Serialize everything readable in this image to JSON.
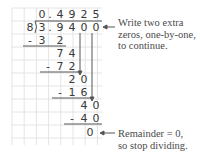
{
  "quotient": [
    "0",
    ".",
    "4",
    "9",
    "2",
    "5"
  ],
  "divisor": "8",
  "dividend": [
    "3",
    ".",
    "9",
    "4",
    "0",
    "0"
  ],
  "steps": [
    {
      "sub": [
        "-",
        "3",
        "2"
      ]
    },
    {
      "rem": [
        "7",
        "4"
      ]
    },
    {
      "sub": [
        "-",
        "7",
        "2"
      ]
    },
    {
      "rem": [
        "2",
        "0"
      ]
    },
    {
      "sub": [
        "-",
        "1",
        "6"
      ]
    },
    {
      "rem": [
        "4",
        "0"
      ]
    },
    {
      "sub": [
        "-",
        "4",
        "0"
      ]
    },
    {
      "rem": [
        "0"
      ]
    }
  ],
  "annotations": {
    "extra_zeros": [
      "Write two extra",
      "zeros, one-by-one,",
      "to continue."
    ],
    "remainder": [
      "Remainder = 0,",
      "so stop dividing."
    ]
  },
  "colors": {
    "grid": "#e4e4e4",
    "ink": "#3a3a3a"
  }
}
